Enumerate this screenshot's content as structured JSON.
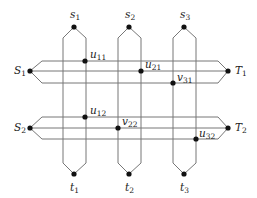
{
  "diagram": {
    "type": "grid-network",
    "colors": {
      "line": "#777777",
      "dot": "#111111",
      "text": "#222222"
    },
    "sources_top": [
      {
        "id": "s1",
        "base": "s",
        "sub": "1",
        "x": 74,
        "y": 27
      },
      {
        "id": "s2",
        "base": "s",
        "sub": "2",
        "x": 129,
        "y": 27
      },
      {
        "id": "s3",
        "base": "s",
        "sub": "3",
        "x": 184,
        "y": 27
      }
    ],
    "sinks_bottom": [
      {
        "id": "t1",
        "base": "t",
        "sub": "1",
        "x": 74,
        "y": 174
      },
      {
        "id": "t2",
        "base": "t",
        "sub": "2",
        "x": 129,
        "y": 174
      },
      {
        "id": "t3",
        "base": "t",
        "sub": "3",
        "x": 184,
        "y": 174
      }
    ],
    "sources_left": [
      {
        "id": "S1",
        "base": "S",
        "sub": "1",
        "x": 30,
        "y": 71
      },
      {
        "id": "S2",
        "base": "S",
        "sub": "2",
        "x": 30,
        "y": 128
      }
    ],
    "sinks_right": [
      {
        "id": "T1",
        "base": "T",
        "sub": "1",
        "x": 228,
        "y": 71
      },
      {
        "id": "T2",
        "base": "T",
        "sub": "2",
        "x": 228,
        "y": 128
      }
    ],
    "intersection_nodes": [
      {
        "id": "u11",
        "base": "u",
        "sub": "11",
        "x": 85,
        "y": 61
      },
      {
        "id": "u21",
        "base": "u",
        "sub": "21",
        "x": 141,
        "y": 71
      },
      {
        "id": "v31",
        "base": "v",
        "sub": "31",
        "x": 173,
        "y": 83
      },
      {
        "id": "u12",
        "base": "u",
        "sub": "12",
        "x": 85,
        "y": 117
      },
      {
        "id": "v22",
        "base": "v",
        "sub": "22",
        "x": 118,
        "y": 128
      },
      {
        "id": "u32",
        "base": "u",
        "sub": "32",
        "x": 196,
        "y": 139
      }
    ]
  }
}
